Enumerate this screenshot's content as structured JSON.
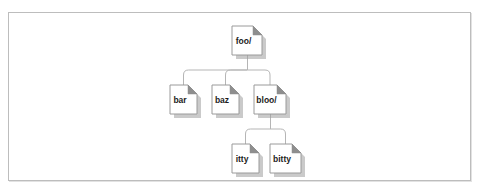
{
  "figure": {
    "kind": "directory-tree-diagram",
    "frame": {
      "border_color": "#bdbdbd",
      "background_color": "#ffffff",
      "shadow_color": "#e2e2e2"
    },
    "node_style": {
      "shape": "document-folded-corner",
      "fill": "#ffffff",
      "stroke": "#9a9a9a",
      "shadow": "#9e9e9e",
      "fold_fill": "#8e8e8e",
      "text_color": "#1c1c1c"
    },
    "connector_style": {
      "stroke": "#b5b5b5",
      "width": 1,
      "corner_radius": 5
    }
  },
  "tree": {
    "root": "foo/",
    "nodes": [
      {
        "id": "foo",
        "label": "foo/",
        "x": 232,
        "y": 26,
        "w": 30,
        "h": 29,
        "level": 0,
        "parent": null
      },
      {
        "id": "bar",
        "label": "bar",
        "x": 170,
        "y": 85,
        "w": 27,
        "h": 29,
        "level": 1,
        "parent": "foo"
      },
      {
        "id": "baz",
        "label": "baz",
        "x": 212,
        "y": 85,
        "w": 27,
        "h": 29,
        "level": 1,
        "parent": "foo"
      },
      {
        "id": "bloo",
        "label": "bloo/",
        "x": 254,
        "y": 85,
        "w": 32,
        "h": 29,
        "level": 1,
        "parent": "foo"
      },
      {
        "id": "itty",
        "label": "itty",
        "x": 232,
        "y": 144,
        "w": 27,
        "h": 29,
        "level": 2,
        "parent": "bloo"
      },
      {
        "id": "bitty",
        "label": "bitty",
        "x": 270,
        "y": 144,
        "w": 31,
        "h": 29,
        "level": 2,
        "parent": "bloo"
      }
    ],
    "edges": [
      {
        "from": "foo",
        "to": "bar"
      },
      {
        "from": "foo",
        "to": "baz"
      },
      {
        "from": "foo",
        "to": "bloo"
      },
      {
        "from": "bloo",
        "to": "itty"
      },
      {
        "from": "bloo",
        "to": "bitty"
      }
    ]
  },
  "labels": {
    "foo": "foo/",
    "bar": "bar",
    "baz": "baz",
    "bloo": "bloo/",
    "itty": "itty",
    "bitty": "bitty"
  }
}
